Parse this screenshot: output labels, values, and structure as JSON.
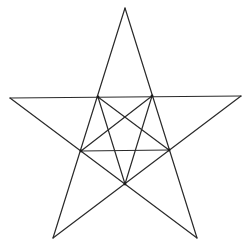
{
  "diagram": {
    "stroke_color": "#2a2a2a",
    "background_color": "#ffffff",
    "outer_points": {
      "top": [
        125,
        8
      ],
      "left": [
        10,
        98
      ],
      "right": [
        241,
        96
      ],
      "bottom_left": [
        53,
        238
      ],
      "bottom_right": [
        197,
        238
      ]
    },
    "inner_vertices": {
      "upper_left": [
        98,
        97
      ],
      "upper_right": [
        152,
        96
      ],
      "right": [
        169,
        150
      ],
      "bottom": [
        125,
        184
      ],
      "left": [
        81,
        151
      ]
    },
    "outer_lines": [
      {
        "name": "top-to-bottom-left",
        "from": [
          125,
          8
        ],
        "to": [
          53,
          238
        ]
      },
      {
        "name": "top-to-bottom-right",
        "from": [
          125,
          8
        ],
        "to": [
          197,
          238
        ]
      },
      {
        "name": "left-to-right",
        "from": [
          10,
          98
        ],
        "to": [
          241,
          96
        ]
      },
      {
        "name": "left-to-bottom-right",
        "from": [
          10,
          98
        ],
        "to": [
          197,
          238
        ]
      },
      {
        "name": "right-to-bottom-left",
        "from": [
          241,
          96
        ],
        "to": [
          53,
          238
        ]
      }
    ],
    "inner_lines": [
      {
        "name": "inner-left-to-inner-right",
        "from": [
          81,
          151
        ],
        "to": [
          169,
          150
        ]
      },
      {
        "name": "inner-upper-left-to-inner-right",
        "from": [
          98,
          97
        ],
        "to": [
          169,
          150
        ]
      },
      {
        "name": "inner-upper-left-to-inner-bottom",
        "from": [
          98,
          97
        ],
        "to": [
          125,
          184
        ]
      },
      {
        "name": "inner-upper-right-to-inner-left",
        "from": [
          152,
          96
        ],
        "to": [
          81,
          151
        ]
      },
      {
        "name": "inner-upper-right-to-inner-bottom",
        "from": [
          152,
          96
        ],
        "to": [
          125,
          184
        ]
      }
    ]
  }
}
